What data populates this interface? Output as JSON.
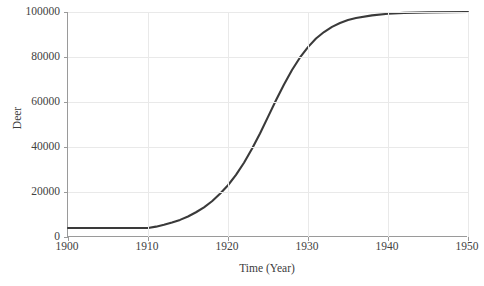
{
  "chart_data": {
    "type": "line",
    "title": "",
    "xlabel": "Time (Year)",
    "ylabel": "Deer",
    "xlim": [
      1900,
      1950
    ],
    "ylim": [
      0,
      100000
    ],
    "grid": true,
    "legend": null,
    "line_color": "#3a3a3a",
    "x_ticks": [
      1900,
      1910,
      1920,
      1930,
      1940,
      1950
    ],
    "x_tick_labels": [
      "1900",
      "1910",
      "1920",
      "1930",
      "1940",
      "1950"
    ],
    "y_ticks": [
      0,
      20000,
      40000,
      60000,
      80000,
      100000
    ],
    "y_tick_labels": [
      "0",
      "20000",
      "40000",
      "60000",
      "80000",
      "100000"
    ],
    "series": [
      {
        "name": "Deer",
        "x": [
          1900,
          1902,
          1904,
          1906,
          1908,
          1910,
          1911,
          1912,
          1913,
          1914,
          1915,
          1916,
          1917,
          1918,
          1919,
          1920,
          1921,
          1922,
          1923,
          1924,
          1925,
          1926,
          1927,
          1928,
          1929,
          1930,
          1931,
          1932,
          1933,
          1934,
          1935,
          1936,
          1938,
          1940,
          1942,
          1945,
          1950
        ],
        "values": [
          4000,
          4000,
          4000,
          4000,
          4000,
          4000,
          4600,
          5400,
          6400,
          7600,
          9100,
          11000,
          13200,
          15900,
          19200,
          23000,
          27600,
          33000,
          39200,
          46000,
          53400,
          60800,
          67800,
          74200,
          79800,
          84400,
          88200,
          91100,
          93400,
          95100,
          96400,
          97300,
          98500,
          99200,
          99600,
          99850,
          100000
        ]
      }
    ]
  },
  "axis": {
    "y_label_text": "Deer",
    "x_label_text": "Time (Year)"
  }
}
